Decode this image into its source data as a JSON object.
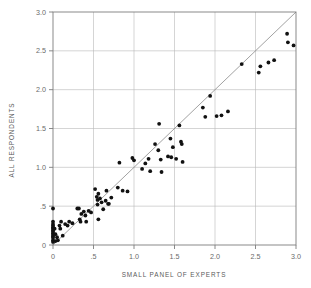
{
  "chart_data": {
    "type": "scatter",
    "title": "",
    "xlabel": "SMALL PANEL OF EXPERTS",
    "ylabel": "ALL RESPONDENTS",
    "xlim": [
      0,
      3.0
    ],
    "ylim": [
      0,
      3.0
    ],
    "xticks": [
      0,
      0.5,
      1.0,
      1.5,
      2.0,
      2.5,
      3.0
    ],
    "xtick_labels": [
      "0",
      ".5",
      "1.0",
      "1.5",
      "2.0",
      "2.5",
      "3.0"
    ],
    "yticks": [
      0,
      0.5,
      1.0,
      1.5,
      2.0,
      2.5,
      3.0
    ],
    "ytick_labels": [
      "0",
      ".5",
      "1.0",
      "1.5",
      "2.0",
      "2.5",
      "3.0"
    ],
    "grid": true,
    "legend": "none",
    "marker": "filled-circle",
    "marker_color": "#111111",
    "reference_line": {
      "name": "identity-line",
      "from": [
        0,
        0
      ],
      "to": [
        3.0,
        3.0
      ],
      "slope": 1.0,
      "intercept": 0.0,
      "color": "#8a8a8a"
    },
    "points": [
      [
        0.0,
        0.47
      ],
      [
        0.0,
        0.3
      ],
      [
        0.0,
        0.27
      ],
      [
        0.0,
        0.25
      ],
      [
        0.0,
        0.23
      ],
      [
        0.0,
        0.21
      ],
      [
        0.0,
        0.19
      ],
      [
        0.0,
        0.17
      ],
      [
        0.0,
        0.15
      ],
      [
        0.0,
        0.13
      ],
      [
        0.0,
        0.11
      ],
      [
        0.0,
        0.09
      ],
      [
        0.0,
        0.06
      ],
      [
        0.0,
        0.04
      ],
      [
        0.02,
        0.21
      ],
      [
        0.03,
        0.14
      ],
      [
        0.03,
        0.05
      ],
      [
        0.05,
        0.1
      ],
      [
        0.06,
        0.06
      ],
      [
        0.08,
        0.25
      ],
      [
        0.09,
        0.21
      ],
      [
        0.1,
        0.3
      ],
      [
        0.12,
        0.12
      ],
      [
        0.15,
        0.27
      ],
      [
        0.18,
        0.25
      ],
      [
        0.2,
        0.3
      ],
      [
        0.24,
        0.28
      ],
      [
        0.3,
        0.47
      ],
      [
        0.32,
        0.47
      ],
      [
        0.33,
        0.33
      ],
      [
        0.34,
        0.3
      ],
      [
        0.35,
        0.4
      ],
      [
        0.38,
        0.43
      ],
      [
        0.4,
        0.38
      ],
      [
        0.41,
        0.3
      ],
      [
        0.44,
        0.44
      ],
      [
        0.47,
        0.42
      ],
      [
        0.52,
        0.72
      ],
      [
        0.54,
        0.62
      ],
      [
        0.55,
        0.58
      ],
      [
        0.55,
        0.52
      ],
      [
        0.56,
        0.66
      ],
      [
        0.56,
        0.33
      ],
      [
        0.58,
        0.6
      ],
      [
        0.6,
        0.55
      ],
      [
        0.62,
        0.46
      ],
      [
        0.65,
        0.57
      ],
      [
        0.66,
        0.7
      ],
      [
        0.68,
        0.53
      ],
      [
        0.69,
        0.53
      ],
      [
        0.72,
        0.61
      ],
      [
        0.8,
        0.74
      ],
      [
        0.82,
        1.06
      ],
      [
        0.86,
        0.7
      ],
      [
        0.92,
        0.69
      ],
      [
        0.98,
        1.12
      ],
      [
        1.0,
        1.09
      ],
      [
        1.1,
        0.98
      ],
      [
        1.14,
        1.05
      ],
      [
        1.18,
        1.11
      ],
      [
        1.2,
        0.95
      ],
      [
        1.26,
        1.3
      ],
      [
        1.3,
        1.22
      ],
      [
        1.31,
        1.56
      ],
      [
        1.33,
        1.1
      ],
      [
        1.34,
        0.94
      ],
      [
        1.42,
        1.14
      ],
      [
        1.45,
        1.37
      ],
      [
        1.46,
        1.13
      ],
      [
        1.48,
        1.26
      ],
      [
        1.52,
        1.11
      ],
      [
        1.56,
        1.54
      ],
      [
        1.58,
        1.33
      ],
      [
        1.59,
        1.3
      ],
      [
        1.6,
        1.07
      ],
      [
        1.85,
        1.77
      ],
      [
        1.88,
        1.65
      ],
      [
        1.94,
        1.92
      ],
      [
        2.02,
        1.66
      ],
      [
        2.08,
        1.67
      ],
      [
        2.16,
        1.72
      ],
      [
        2.33,
        2.33
      ],
      [
        2.54,
        2.22
      ],
      [
        2.56,
        2.3
      ],
      [
        2.66,
        2.35
      ],
      [
        2.73,
        2.38
      ],
      [
        2.89,
        2.72
      ],
      [
        2.9,
        2.61
      ],
      [
        2.97,
        2.57
      ]
    ]
  },
  "figure": {
    "caption": ""
  }
}
